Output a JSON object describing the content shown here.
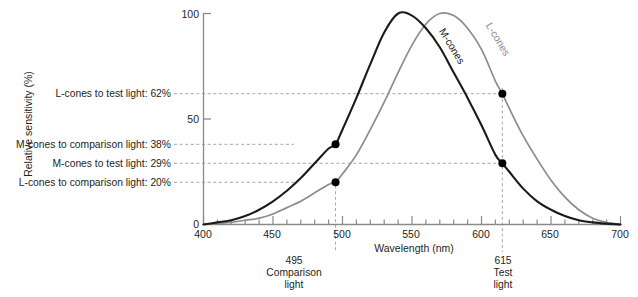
{
  "chart_data": {
    "type": "line",
    "title": "",
    "xlabel": "Wavelength (nm)",
    "ylabel": "Relative sensitivity (%)",
    "xlim": [
      400,
      700
    ],
    "ylim": [
      0,
      100
    ],
    "xticks": [
      400,
      450,
      500,
      550,
      600,
      650,
      700
    ],
    "xtick_labels": [
      "400",
      "450",
      "500",
      "550",
      "600",
      "650",
      "700"
    ],
    "yticks": [
      0,
      50,
      100
    ],
    "ytick_labels": [
      "0",
      "50",
      "100"
    ],
    "minor_tick_step": 10,
    "grid": false,
    "legend_position": "inline-curve-labels",
    "series": [
      {
        "name": "M-cones",
        "color": "#1a1a1a",
        "peak_x": 540,
        "peak_y": 100,
        "x": [
          400,
          410,
          420,
          430,
          440,
          450,
          460,
          470,
          480,
          490,
          495,
          500,
          510,
          520,
          530,
          540,
          550,
          560,
          570,
          580,
          590,
          600,
          610,
          615,
          620,
          630,
          640,
          650,
          660,
          670,
          680,
          690,
          700
        ],
        "y": [
          0,
          1,
          2,
          4,
          7,
          11,
          16,
          22,
          29,
          36,
          38,
          45,
          60,
          76,
          91,
          100,
          99,
          93,
          84,
          72,
          60,
          47,
          33,
          29,
          25,
          17,
          11,
          7,
          4,
          2,
          1,
          0.4,
          0
        ]
      },
      {
        "name": "L-cones",
        "color": "#8c8c8c",
        "peak_x": 570,
        "peak_y": 100,
        "x": [
          400,
          410,
          420,
          430,
          440,
          450,
          460,
          470,
          480,
          490,
          495,
          500,
          510,
          520,
          530,
          540,
          550,
          560,
          570,
          580,
          590,
          600,
          610,
          615,
          620,
          630,
          640,
          650,
          660,
          670,
          680,
          690,
          700
        ],
        "y": [
          0,
          0.5,
          1,
          2,
          3,
          5,
          8,
          11,
          15,
          19,
          20,
          24,
          33,
          45,
          58,
          72,
          85,
          95,
          100,
          99,
          93,
          83,
          68,
          62,
          55,
          42,
          31,
          21,
          13,
          7,
          3,
          1,
          0
        ]
      }
    ],
    "markers": [
      {
        "name": "m-cones-comparison",
        "x": 495,
        "y": 38,
        "series": "M-cones"
      },
      {
        "name": "l-cones-comparison",
        "x": 495,
        "y": 20,
        "series": "L-cones"
      },
      {
        "name": "l-cones-test",
        "x": 615,
        "y": 62,
        "series": "L-cones"
      },
      {
        "name": "m-cones-test",
        "x": 615,
        "y": 29,
        "series": "M-cones"
      }
    ],
    "horizontal_annotations": [
      {
        "label": "L-cones to test light: 62%",
        "value": 62
      },
      {
        "label": "M-cones to comparison light: 38%",
        "value": 38
      },
      {
        "label": "M-cones to test light: 29%",
        "value": 29
      },
      {
        "label": "L-cones to comparison light: 20%",
        "value": 20
      }
    ],
    "vertical_annotations": [
      {
        "value": 495,
        "lines": [
          "495",
          "Comparison",
          "light"
        ]
      },
      {
        "value": 615,
        "lines": [
          "615",
          "Test",
          "light"
        ]
      }
    ]
  },
  "axes": {
    "x_title": "Wavelength (nm)",
    "y_title": "Relative sensitivity (%)",
    "x_tick_400": "400",
    "x_tick_450": "450",
    "x_tick_500": "500",
    "x_tick_550": "550",
    "x_tick_600": "600",
    "x_tick_650": "650",
    "x_tick_700": "700",
    "y_tick_0": "0",
    "y_tick_50": "50",
    "y_tick_100": "100"
  },
  "curve_labels": {
    "m_cones": "M-cones",
    "l_cones": "L-cones"
  },
  "annotations": {
    "l_test": "L-cones to test light: 62%",
    "m_comparison": "M-cones to comparison light: 38%",
    "m_test": "M-cones to test light: 29%",
    "l_comparison": "L-cones to comparison light: 20%",
    "comparison_value": "495",
    "comparison_line1": "Comparison",
    "comparison_line2": "light",
    "test_value": "615",
    "test_line1": "Test",
    "test_line2": "light"
  },
  "colors": {
    "m_curve": "#1a1a1a",
    "l_curve": "#8c8c8c",
    "axis": "#808080",
    "dashed": "#a6a6a6",
    "text": "#231f20",
    "marker": "#000000"
  }
}
